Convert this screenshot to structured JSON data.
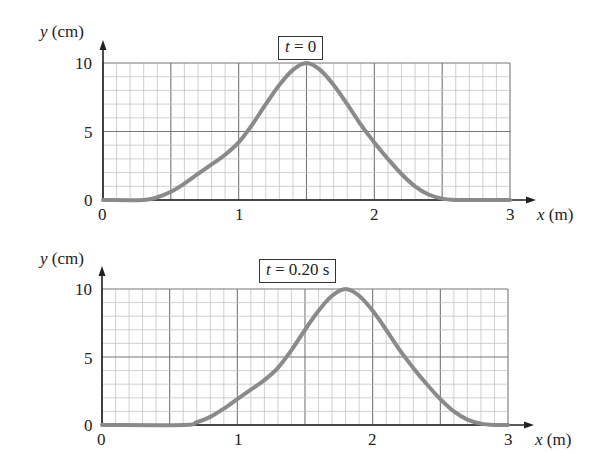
{
  "chart_data": [
    {
      "type": "line",
      "title": "t = 0",
      "title_var": "t",
      "title_rest": " = 0",
      "xlabel": "x (m)",
      "xlabel_var": "x",
      "xlabel_unit": " (m)",
      "ylabel": "y (cm)",
      "ylabel_var": "y",
      "ylabel_unit": " (cm)",
      "xlim": [
        0,
        3
      ],
      "ylim": [
        0,
        10
      ],
      "xticks": [
        "0",
        "1",
        "2",
        "3"
      ],
      "yticks": [
        "0",
        "5",
        "10"
      ],
      "grid": true,
      "grid_minor_x": 0.1,
      "grid_minor_y": 1,
      "legend": null,
      "series": [
        {
          "name": "pulse at t = 0",
          "color": "#8a8a8a",
          "x": [
            0.0,
            0.3,
            0.4,
            0.5,
            0.6,
            0.7,
            0.8,
            0.9,
            1.0,
            1.1,
            1.2,
            1.3,
            1.4,
            1.5,
            1.6,
            1.7,
            1.8,
            1.9,
            2.0,
            2.1,
            2.2,
            2.3,
            2.4,
            2.5,
            2.6,
            2.7,
            3.0
          ],
          "y": [
            0.0,
            0.0,
            0.2,
            0.6,
            1.2,
            1.9,
            2.6,
            3.3,
            4.2,
            5.5,
            7.0,
            8.4,
            9.5,
            10.0,
            9.5,
            8.4,
            7.0,
            5.5,
            4.2,
            3.0,
            1.9,
            1.0,
            0.4,
            0.1,
            0.0,
            0.0,
            0.0
          ]
        }
      ]
    },
    {
      "type": "line",
      "title": "t = 0.20 s",
      "title_var": "t",
      "title_rest": " = 0.20 s",
      "xlabel": "x (m)",
      "xlabel_var": "x",
      "xlabel_unit": " (m)",
      "ylabel": "y (cm)",
      "ylabel_var": "y",
      "ylabel_unit": " (cm)",
      "xlim": [
        0,
        3
      ],
      "ylim": [
        0,
        10
      ],
      "xticks": [
        "0",
        "1",
        "2",
        "3"
      ],
      "yticks": [
        "0",
        "5",
        "10"
      ],
      "grid": true,
      "grid_minor_x": 0.1,
      "grid_minor_y": 1,
      "legend": null,
      "series": [
        {
          "name": "pulse at t = 0.20 s",
          "color": "#8a8a8a",
          "x": [
            0.0,
            0.6,
            0.7,
            0.8,
            0.9,
            1.0,
            1.1,
            1.2,
            1.3,
            1.4,
            1.5,
            1.6,
            1.7,
            1.8,
            1.9,
            2.0,
            2.1,
            2.2,
            2.3,
            2.4,
            2.5,
            2.6,
            2.7,
            2.8,
            2.9,
            3.0
          ],
          "y": [
            0.0,
            0.0,
            0.2,
            0.6,
            1.2,
            1.9,
            2.6,
            3.3,
            4.2,
            5.5,
            7.0,
            8.4,
            9.5,
            10.0,
            9.5,
            8.4,
            7.0,
            5.5,
            4.2,
            3.0,
            1.9,
            1.0,
            0.4,
            0.1,
            0.0,
            0.0
          ]
        }
      ]
    }
  ],
  "layout": {
    "panels": [
      {
        "plot_left": 103,
        "plot_right": 510,
        "plot_top": 63,
        "plot_bottom": 200,
        "arrow_right": 536,
        "arrow_top": 40
      },
      {
        "plot_left": 102,
        "plot_right": 508,
        "plot_top": 289,
        "plot_bottom": 425,
        "arrow_right": 534,
        "arrow_top": 266
      }
    ]
  }
}
